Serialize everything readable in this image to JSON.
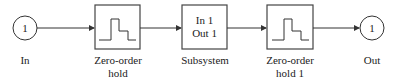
{
  "diagram": {
    "colors": {
      "stroke": "#333333",
      "text": "#222222",
      "background": "#ffffff"
    },
    "blocks": [
      {
        "id": "in",
        "type": "inport",
        "number": "1",
        "label": "In"
      },
      {
        "id": "zoh",
        "type": "zero-order-hold",
        "label_line1": "Zero-order",
        "label_line2": "hold"
      },
      {
        "id": "subsystem",
        "type": "subsystem",
        "inner_line1": "In 1",
        "inner_line2": "Out 1",
        "label": "Subsystem"
      },
      {
        "id": "zoh1",
        "type": "zero-order-hold",
        "label_line1": "Zero-order",
        "label_line2": "hold 1"
      },
      {
        "id": "out",
        "type": "outport",
        "number": "1",
        "label": "Out"
      }
    ],
    "connections": [
      {
        "from": "In",
        "to": "Zero-order hold"
      },
      {
        "from": "Zero-order hold",
        "to": "Subsystem"
      },
      {
        "from": "Subsystem",
        "to": "Zero-order hold 1"
      },
      {
        "from": "Zero-order hold 1",
        "to": "Out"
      }
    ]
  }
}
